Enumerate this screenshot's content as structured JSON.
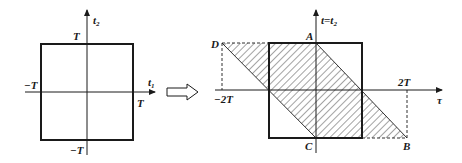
{
  "left_diagram": {
    "axis_x_label": "t",
    "axis_x_sub": "1",
    "axis_y_label": "t",
    "axis_y_sub": "2",
    "top_label": "T",
    "bottom_label": "−T",
    "left_label": "−T",
    "right_label": "T"
  },
  "transform_arrow": "right-arrow-icon",
  "right_diagram": {
    "axis_x_label": "τ",
    "axis_y_label": "t=t",
    "axis_y_sub": "2",
    "left_tick_label": "−2T",
    "right_tick_label": "2T",
    "point_A": "A",
    "point_B": "B",
    "point_C": "C",
    "point_D": "D"
  },
  "colors": {
    "stroke": "#1a1a1a",
    "hatch": "#333333",
    "background": "#ffffff"
  }
}
